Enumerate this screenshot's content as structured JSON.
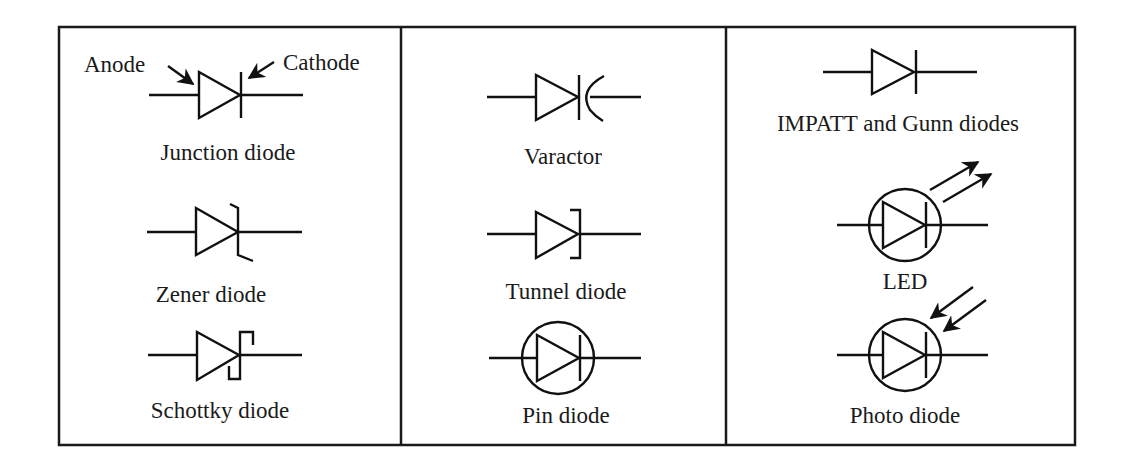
{
  "figure": {
    "columns": [
      {
        "items": [
          {
            "id": "junction",
            "label": "Junction diode",
            "annotations": [
              "Anode",
              "Cathode"
            ]
          },
          {
            "id": "zener",
            "label": "Zener diode"
          },
          {
            "id": "schottky",
            "label": "Schottky diode"
          }
        ]
      },
      {
        "items": [
          {
            "id": "varactor",
            "label": "Varactor"
          },
          {
            "id": "tunnel",
            "label": "Tunnel diode"
          },
          {
            "id": "pin",
            "label": "Pin diode"
          }
        ]
      },
      {
        "items": [
          {
            "id": "impatt",
            "label": "IMPATT and Gunn diodes"
          },
          {
            "id": "led",
            "label": "LED"
          },
          {
            "id": "photo",
            "label": "Photo diode"
          }
        ]
      }
    ],
    "colors": {
      "ink": "#111111",
      "background": "#ffffff"
    }
  }
}
